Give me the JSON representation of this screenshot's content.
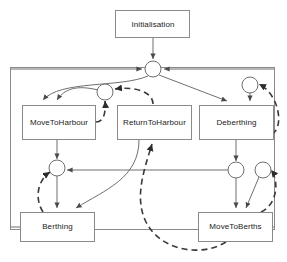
{
  "diagram": {
    "type": "state-machine-diagram",
    "colors": {
      "box_stroke": "#8a8a8a",
      "box_fill": "#ffffff",
      "solid_edge": "#6f6f6f",
      "dashed_edge": "#3a3a3a",
      "label_text": "#222222",
      "background": "#ffffff"
    },
    "nodes": [
      {
        "id": "initialisation",
        "label": "Initialisation",
        "x": 115,
        "y": 10,
        "w": 75,
        "h": 28
      },
      {
        "id": "movetoharbour",
        "label": "MoveToHarbour",
        "x": 22,
        "y": 105,
        "w": 74,
        "h": 35
      },
      {
        "id": "returntoharbour",
        "label": "ReturnToHarbour",
        "x": 117,
        "y": 105,
        "w": 75,
        "h": 35
      },
      {
        "id": "deberthing",
        "label": "Deberthing",
        "x": 199,
        "y": 105,
        "w": 75,
        "h": 35
      },
      {
        "id": "berthing",
        "label": "Berthing",
        "x": 20,
        "y": 212,
        "w": 75,
        "h": 30
      },
      {
        "id": "movetoberths",
        "label": "MoveToBerths",
        "x": 198,
        "y": 212,
        "w": 75,
        "h": 30
      }
    ],
    "junctions": [
      {
        "id": "junction-top",
        "cx": 153,
        "cy": 69,
        "r": 8
      },
      {
        "id": "junction-harbour",
        "cx": 105,
        "cy": 92,
        "r": 8
      },
      {
        "id": "junction-deberthing",
        "cx": 250,
        "cy": 85,
        "r": 8
      },
      {
        "id": "junction-berthing",
        "cx": 57,
        "cy": 168,
        "r": 8
      },
      {
        "id": "junction-berths-left",
        "cx": 236,
        "cy": 170,
        "r": 8
      },
      {
        "id": "junction-berths-right",
        "cx": 263,
        "cy": 170,
        "r": 8
      }
    ],
    "frame": {
      "id": "outer-frame",
      "x": 10,
      "y": 67,
      "w": 265,
      "h": 163
    },
    "edges": [
      {
        "id": "e-init-top",
        "style": "solid",
        "from": "initialisation",
        "to": "junction-top"
      },
      {
        "id": "e-top-frameleft",
        "style": "solid",
        "from": "frame-left",
        "to": "junction-top"
      },
      {
        "id": "e-top-frameright",
        "style": "solid",
        "from": "frame-right",
        "to": "junction-top"
      },
      {
        "id": "e-top-deberthing",
        "style": "solid",
        "from": "junction-top",
        "to": "deberthing"
      },
      {
        "id": "e-top-movetoharbour",
        "style": "solid",
        "from": "junction-top",
        "to": "movetoharbour"
      },
      {
        "id": "e-harbour-movetoharbour",
        "style": "dashed",
        "from": "junction-harbour",
        "to": "movetoharbour"
      },
      {
        "id": "e-movetoharbour-harbour",
        "style": "dashed",
        "from": "movetoharbour",
        "to": "junction-harbour"
      },
      {
        "id": "e-returntoharbour-harbour",
        "style": "dashed",
        "from": "returntoharbour",
        "to": "junction-harbour"
      },
      {
        "id": "e-harbour-movetoharbour2",
        "style": "solid",
        "from": "junction-harbour",
        "to": "movetoharbour"
      },
      {
        "id": "e-deb-junction-deberthing",
        "style": "solid",
        "from": "junction-deberthing",
        "to": "deberthing"
      },
      {
        "id": "e-deberthing-loop",
        "style": "dashed",
        "from": "deberthing",
        "to": "junction-deberthing"
      },
      {
        "id": "e-movetoharbour-berthjn",
        "style": "solid",
        "from": "movetoharbour",
        "to": "junction-berthing"
      },
      {
        "id": "e-berthjn-berthing",
        "style": "solid",
        "from": "junction-berthing",
        "to": "berthing"
      },
      {
        "id": "e-berthjn-berthing-dashed",
        "style": "dashed",
        "from": "berthing",
        "to": "junction-berthing"
      },
      {
        "id": "e-returntoharbour-berthing",
        "style": "solid",
        "from": "returntoharbour",
        "to": "berthing"
      },
      {
        "id": "e-berthsjn-berthjn",
        "style": "solid",
        "from": "junction-berths-left",
        "to": "junction-berthing"
      },
      {
        "id": "e-deberthing-berthsjn",
        "style": "solid",
        "from": "deberthing",
        "to": "junction-berths-left"
      },
      {
        "id": "e-berthsjn-movetoberths",
        "style": "solid",
        "from": "junction-berths-left",
        "to": "movetoberths"
      },
      {
        "id": "e-berthsjn2-movetoberths",
        "style": "solid",
        "from": "junction-berths-right",
        "to": "movetoberths"
      },
      {
        "id": "e-movetoberths-loop",
        "style": "dashed",
        "from": "movetoberths",
        "to": "junction-berths-right"
      },
      {
        "id": "e-movetoberths-return",
        "style": "dashed",
        "from": "movetoberths",
        "to": "returntoharbour"
      },
      {
        "id": "e-berthing-frameleft",
        "style": "solid",
        "from": "berthing",
        "to": "frame-left"
      },
      {
        "id": "e-movetoberths-frameright",
        "style": "solid",
        "from": "movetoberths",
        "to": "frame-right"
      }
    ]
  }
}
